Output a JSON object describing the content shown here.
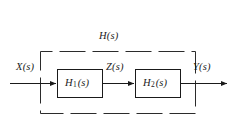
{
  "diagram": {
    "type": "block-diagram",
    "overall_system": {
      "label_base": "H",
      "label_arg": "(s)",
      "label_full": "H(s)",
      "boundary_style": "dashed"
    },
    "signals": [
      {
        "id": "input",
        "label_base": "X",
        "label_arg": "(s)",
        "label_full": "X(s)",
        "position": "left-input"
      },
      {
        "id": "intermediate",
        "label_base": "Z",
        "label_arg": "(s)",
        "label_full": "Z(s)",
        "position": "between-blocks"
      },
      {
        "id": "output",
        "label_base": "Y",
        "label_arg": "(s)",
        "label_full": "Y(s)",
        "position": "right-output"
      }
    ],
    "blocks": [
      {
        "id": "block1",
        "label_base": "H",
        "subscript": "1",
        "label_arg": "(s)",
        "label_full": "H1(s)"
      },
      {
        "id": "block2",
        "label_base": "H",
        "subscript": "2",
        "label_arg": "(s)",
        "label_full": "H2(s)"
      }
    ],
    "colors": {
      "background": "#ffffff",
      "stroke": "#1a1a1a",
      "dashed_stroke": "#2b2b2b",
      "text": "#1a1a1a"
    }
  }
}
